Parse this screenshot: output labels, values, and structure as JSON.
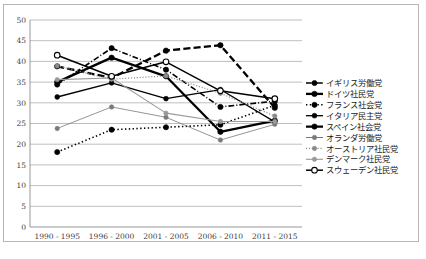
{
  "chart_data": {
    "type": "line",
    "title": "",
    "xlabel": "",
    "ylabel": "",
    "ylim": [
      0,
      50
    ],
    "ytick_step": 5,
    "grid": true,
    "legend_position": "right",
    "categories": [
      "1990 - 1995",
      "1996 - 2000",
      "2001 - 2005",
      "2006 - 2010",
      "2011 - 2015"
    ],
    "yticks": [
      "0",
      "5",
      "10",
      "15",
      "20",
      "25",
      "30",
      "35",
      "40",
      "45",
      "50"
    ],
    "series": [
      {
        "name": "イギリス労働党",
        "style": "dashdot",
        "width": 1.6,
        "color": "#000000",
        "marker": "filled-circle",
        "marker_size": 2.6,
        "values": [
          34.4,
          43.2,
          38.0,
          29.0,
          30.4
        ]
      },
      {
        "name": "ドイツ社民党",
        "style": "solid",
        "width": 2.3,
        "color": "#000000",
        "marker": "filled-circle",
        "marker_size": 2.7,
        "values": [
          35.0,
          40.9,
          36.4,
          23.0,
          25.7
        ]
      },
      {
        "name": "フランス社会党",
        "style": "dotted",
        "width": 1.6,
        "color": "#000000",
        "marker": "filled-circle",
        "marker_size": 2.6,
        "values": [
          18.1,
          23.5,
          24.1,
          24.7,
          29.4
        ]
      },
      {
        "name": "イタリア民主党",
        "style": "solid",
        "width": 1.3,
        "color": "#000000",
        "marker": "filled-circle",
        "marker_size": 2.4,
        "values": [
          31.4,
          34.8,
          31.0,
          33.2,
          25.4
        ]
      },
      {
        "name": "スペイン社会党",
        "style": "dashed",
        "width": 2.3,
        "color": "#000000",
        "marker": "filled-circle",
        "marker_size": 2.7,
        "values": [
          38.8,
          36.0,
          42.6,
          43.9,
          28.8
        ]
      },
      {
        "name": "オランダ労働党",
        "style": "solid",
        "width": 0.8,
        "color": "#7a7a7a",
        "marker": "filled-circle",
        "marker_size": 2.2,
        "values": [
          23.8,
          29.0,
          26.5,
          21.0,
          24.8
        ]
      },
      {
        "name": "オーストリア社民党",
        "style": "dotted",
        "width": 1.2,
        "color": "#8a8a8a",
        "marker": "filled-circle",
        "marker_size": 2.2,
        "values": [
          38.9,
          35.7,
          36.5,
          32.3,
          26.8
        ]
      },
      {
        "name": "デンマーク社民党",
        "style": "solid",
        "width": 1.1,
        "color": "#9a9a9a",
        "marker": "filled-circle",
        "marker_size": 2.2,
        "values": [
          35.6,
          36.0,
          27.5,
          25.5,
          25.5
        ]
      },
      {
        "name": "スウェーデン社民党",
        "style": "solid",
        "width": 1.5,
        "color": "#000000",
        "marker": "open-circle",
        "marker_size": 2.8,
        "values": [
          41.5,
          36.4,
          39.9,
          32.9,
          31.0
        ]
      }
    ]
  }
}
